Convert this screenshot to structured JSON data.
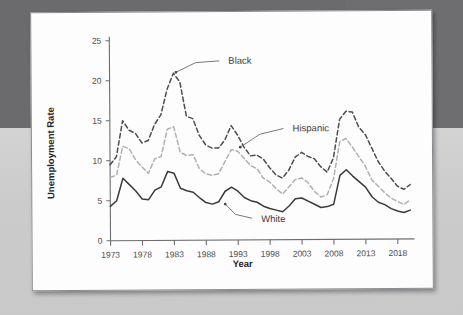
{
  "figure": {
    "background_color": "#fdfdfd",
    "backdrop_color": "#6b6b6e",
    "surface_color": "#cfcfcf"
  },
  "chart_data": {
    "type": "line",
    "title": "",
    "xlabel": "Year",
    "ylabel": "Unemployment Rate",
    "xlim": [
      1973,
      2020
    ],
    "ylim": [
      0,
      25
    ],
    "ytick_labels": [
      "0",
      "5",
      "10",
      "15",
      "20",
      "25"
    ],
    "ytick_values": [
      0,
      5,
      10,
      15,
      20,
      25
    ],
    "xtick_labels": [
      "1973",
      "1978",
      "1983",
      "1988",
      "1993",
      "1998",
      "2003",
      "2008",
      "2013",
      "2018"
    ],
    "xtick_values": [
      1973,
      1978,
      1983,
      1988,
      1993,
      1998,
      2003,
      2008,
      2013,
      2018
    ],
    "grid": false,
    "legend_position": "inline-annotations",
    "x": [
      1973,
      1974,
      1975,
      1976,
      1977,
      1978,
      1979,
      1980,
      1981,
      1982,
      1983,
      1984,
      1985,
      1986,
      1987,
      1988,
      1989,
      1990,
      1991,
      1992,
      1993,
      1994,
      1995,
      1996,
      1997,
      1998,
      1999,
      2000,
      2001,
      2002,
      2003,
      2004,
      2005,
      2006,
      2007,
      2008,
      2009,
      2010,
      2011,
      2012,
      2013,
      2014,
      2015,
      2016,
      2017,
      2018,
      2019,
      2020
    ],
    "series": [
      {
        "name": "Black",
        "color": "#4d4d50",
        "style": "dashed",
        "label_annotation": "Black",
        "values": [
          9.5,
          10.5,
          15.0,
          13.8,
          13.4,
          12.2,
          12.5,
          14.5,
          15.7,
          18.9,
          20.9,
          19.8,
          15.5,
          15.2,
          13.1,
          11.9,
          11.5,
          11.5,
          12.5,
          14.3,
          13.1,
          11.6,
          10.5,
          10.6,
          10.1,
          9.0,
          8.1,
          7.7,
          8.7,
          10.3,
          10.9,
          10.4,
          10.1,
          9.1,
          8.4,
          10.2,
          15.0,
          16.0,
          15.9,
          14.0,
          13.1,
          11.4,
          9.7,
          8.5,
          7.6,
          6.6,
          6.2,
          6.8
        ]
      },
      {
        "name": "Hispanic",
        "color": "#b0b0b3",
        "style": "dashed",
        "label_annotation": "Hispanic",
        "values": [
          7.9,
          8.2,
          11.8,
          11.5,
          10.1,
          9.2,
          8.4,
          10.2,
          10.5,
          13.9,
          14.2,
          11.0,
          10.6,
          10.7,
          8.9,
          8.3,
          8.1,
          8.3,
          9.8,
          11.3,
          11.1,
          10.2,
          9.3,
          8.9,
          7.7,
          7.2,
          6.4,
          5.7,
          6.6,
          7.5,
          7.7,
          7.1,
          6.0,
          5.3,
          5.6,
          7.6,
          12.2,
          12.6,
          11.5,
          10.3,
          9.1,
          7.4,
          6.6,
          5.8,
          5.1,
          4.7,
          4.3,
          4.9
        ]
      },
      {
        "name": "White",
        "color": "#3a3a3d",
        "style": "solid",
        "label_annotation": "White",
        "values": [
          4.3,
          5.0,
          7.8,
          7.0,
          6.2,
          5.2,
          5.1,
          6.3,
          6.7,
          8.6,
          8.4,
          6.5,
          6.2,
          6.0,
          5.3,
          4.7,
          4.5,
          4.8,
          6.1,
          6.6,
          6.1,
          5.3,
          4.9,
          4.7,
          4.2,
          3.9,
          3.7,
          3.5,
          4.2,
          5.1,
          5.2,
          4.8,
          4.4,
          4.0,
          4.1,
          4.4,
          8.0,
          8.7,
          7.9,
          7.2,
          6.5,
          5.3,
          4.6,
          4.3,
          3.8,
          3.5,
          3.3,
          3.6
        ]
      }
    ],
    "annotations": [
      {
        "text": "Black",
        "x": 1991,
        "y": 22.4
      },
      {
        "text": "Hispanic",
        "x": 2001,
        "y": 13.9
      },
      {
        "text": "White",
        "x": 1996,
        "y": 2.6
      }
    ]
  }
}
